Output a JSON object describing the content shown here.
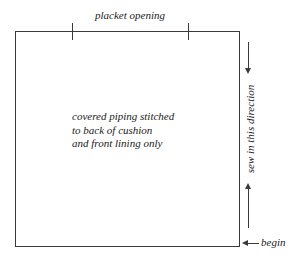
{
  "diagram": {
    "title_label": "placket opening",
    "note_lines": [
      "covered piping stitched",
      "to back of cushion",
      "and front lining only"
    ],
    "direction_label": "sew in this direction",
    "begin_label": "begin",
    "colors": {
      "stroke": "#3a3a3a",
      "background": "#ffffff",
      "text": "#1a1a1a"
    }
  }
}
